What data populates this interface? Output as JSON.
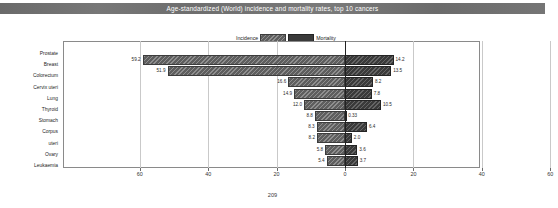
{
  "document": {
    "title": "Age-standardized (World) incidence and mortality rates, top 10 cancers",
    "page_number": "209"
  },
  "legend": {
    "incidence_label": "Incidence",
    "mortality_label": "Mortality",
    "incidence_color": "#5e5e5e",
    "mortality_color": "#3a3a3a"
  },
  "chart_data": {
    "type": "bar",
    "title": "Age-standardized (World) incidence and mortality rates, top 10 cancers",
    "orientation": "horizontal-diverging",
    "xlabel": "",
    "ylabel": "",
    "xlim": [
      -70,
      70
    ],
    "xticks": [
      60,
      40,
      20,
      0,
      20,
      40,
      60
    ],
    "grid": true,
    "legend_position": "top-center",
    "categories": [
      "Prostate",
      "Breast",
      "Colorectum",
      "Cervix uteri",
      "Lung",
      "Thyroid",
      "Stomach",
      "Corpus uteri",
      "Ovary",
      "Leukaemia"
    ],
    "category_label_lines": [
      [
        "Prostate"
      ],
      [
        "Breast"
      ],
      [
        "Colorectum"
      ],
      [
        "Cervix uteri"
      ],
      [
        "Lung"
      ],
      [
        "Thyroid"
      ],
      [
        "Stomach"
      ],
      [
        "Corpus",
        "uteri"
      ],
      [
        "Ovary"
      ],
      [
        "Leukaemia"
      ]
    ],
    "series": [
      {
        "name": "Incidence",
        "direction": "left",
        "values": [
          59.2,
          51.9,
          16.6,
          14.9,
          12.0,
          8.8,
          8.3,
          8.2,
          5.8,
          5.4
        ],
        "value_labels": [
          "59.2",
          "51.9",
          "16.6",
          "14.9",
          "12.0",
          "8.8",
          "8.3",
          "8.2",
          "5.8",
          "5.4"
        ]
      },
      {
        "name": "Mortality",
        "direction": "right",
        "values": [
          14.2,
          13.5,
          8.2,
          7.8,
          10.5,
          0.33,
          6.4,
          2.0,
          3.6,
          3.7
        ],
        "value_labels": [
          "14.2",
          "13.5",
          "8.2",
          "7.8",
          "10.5",
          "0.33",
          "6.4",
          "2.0",
          "3.6",
          "3.7"
        ]
      }
    ]
  }
}
